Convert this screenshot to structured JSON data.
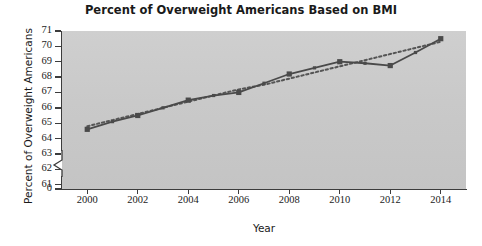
{
  "chart_data": {
    "type": "line",
    "title": "Percent of Overweight Americans Based on BMI",
    "xlabel": "Year",
    "ylabel": "Percent of Overweight Americans",
    "x": [
      2000,
      2001,
      2002,
      2003,
      2004,
      2005,
      2006,
      2007,
      2008,
      2009,
      2010,
      2011,
      2012,
      2013,
      2014
    ],
    "series": [
      {
        "name": "Percent of overweight Americans",
        "style": "solid-line-with-square-markers",
        "color": "#4a4a4a",
        "values": [
          64.6,
          65.1,
          65.5,
          66.0,
          66.5,
          66.8,
          67.0,
          67.6,
          68.2,
          68.6,
          69.0,
          68.9,
          68.75,
          69.6,
          70.5
        ]
      },
      {
        "name": "Linear trend",
        "style": "dotted-trend-line",
        "color": "#555555",
        "values": [
          64.8,
          65.2,
          65.6,
          66.0,
          66.4,
          66.8,
          67.2,
          67.5,
          67.9,
          68.3,
          68.7,
          69.1,
          69.5,
          69.9,
          70.3
        ]
      }
    ],
    "xticks": [
      "2000",
      "2002",
      "2004",
      "2006",
      "2008",
      "2010",
      "2012",
      "2014"
    ],
    "xtick_values": [
      2000,
      2002,
      2004,
      2006,
      2008,
      2010,
      2012,
      2014
    ],
    "yticks": [
      "0",
      "61",
      "62",
      "63",
      "64",
      "65",
      "66",
      "67",
      "68",
      "69",
      "70",
      "71"
    ],
    "ytick_values": [
      0,
      61,
      62,
      63,
      64,
      65,
      66,
      67,
      68,
      69,
      70,
      71
    ],
    "ylim": [
      61,
      71
    ],
    "xlim": [
      1999,
      2015
    ],
    "axis_break": true,
    "axis_break_note": "y-axis broken between 0 and 61",
    "grid": false,
    "legend": "none",
    "plot_background": "#c8c8c8",
    "figure_background": "#ffffff",
    "axis_color": "#3c3c3c"
  }
}
